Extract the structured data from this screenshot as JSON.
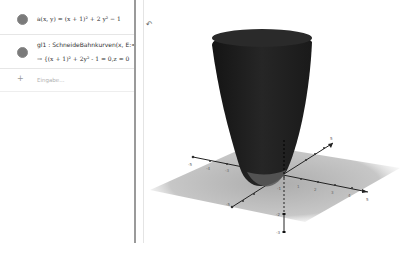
{
  "algebra": {
    "items": [
      {
        "label": "a(x, y) = (x + 1)² + 2 y² − 1",
        "marble_color": "#7a7a7a"
      },
      {
        "label": "gl1 : SchneideBahnkurven(x, E:=",
        "output": "→ {(x + 1)² + 2y² - 1 = 0,z = 0",
        "marble_color": "#7a7a7a"
      }
    ],
    "input_placeholder": "Eingabe...",
    "plus_symbol": "+"
  },
  "graphics": {
    "undo_icon": "↶",
    "x_axis_ticks": [
      "-5",
      "-4",
      "-3",
      "-2",
      "-1",
      "1",
      "2",
      "3",
      "4",
      "5"
    ],
    "y_axis_ticks": [
      "-5",
      "-4",
      "-3",
      "-2",
      "-1",
      "1",
      "2",
      "3",
      "4",
      "5"
    ],
    "z_axis_ticks": [
      "-1",
      "-2",
      "-3"
    ],
    "surface_color": "#1e1e1e",
    "plane_color": "#b3b3b3"
  }
}
